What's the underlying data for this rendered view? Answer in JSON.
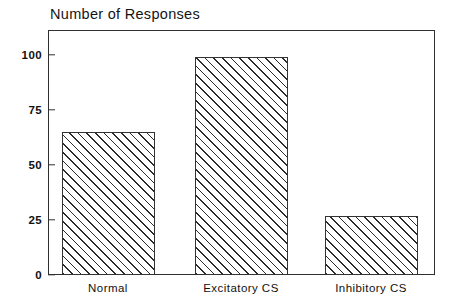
{
  "chart_data": {
    "type": "bar",
    "title": "Number of Responses",
    "xlabel": "",
    "ylabel": "",
    "categories": [
      "Normal",
      "Excitatory CS",
      "Inhibitory CS"
    ],
    "values": [
      65,
      99,
      27
    ],
    "ylim": [
      0,
      110
    ],
    "yticks": [
      0,
      25,
      50,
      75,
      100
    ],
    "ytick_labels": [
      "0",
      "25",
      "50",
      "75",
      "100"
    ],
    "grid": false,
    "legend": false,
    "legend_position": "none",
    "bar_fill": "diagonal-hatch",
    "colors": {
      "axis": "#303030",
      "hatch": "#2b2b2b",
      "bar_border": "#333333",
      "background": "#ffffff",
      "text": "#111111"
    }
  },
  "axis": {
    "y_tick_labels": [
      "100",
      "75",
      "50",
      "25",
      "0"
    ]
  }
}
